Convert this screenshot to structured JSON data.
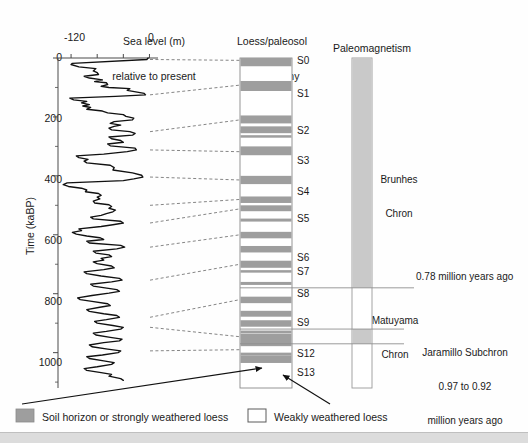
{
  "figure": {
    "title_columns": [
      {
        "name": "sea-level",
        "line1": "Sea level (m)",
        "line2": "relative to present"
      },
      {
        "name": "stratigraphy",
        "line1": "Loess/paleosol",
        "line2": "stratigraphy"
      },
      {
        "name": "paleomagnetism",
        "line1": "Paleomagnetism",
        "line2": ""
      }
    ],
    "y_axis": {
      "label": "Time (kaBP)",
      "ticks": [
        0,
        200,
        400,
        600,
        800,
        1000
      ],
      "minor_ticks": [
        100,
        300,
        500,
        700,
        900,
        1100
      ],
      "range": [
        0,
        1120
      ]
    },
    "x_axis": {
      "labels": [
        "-120",
        "0"
      ],
      "tick_values": [
        -120,
        -80,
        -40,
        0
      ],
      "range": [
        -140,
        10
      ]
    },
    "soil_labels": [
      "S0",
      "S1",
      "S2",
      "S3",
      "S4",
      "S5",
      "S6",
      "S7",
      "S8",
      "S9",
      "S12",
      "S13"
    ],
    "paleomagnetism": {
      "chrons": [
        {
          "name": "Brunhes Chron",
          "line1": "Brunhes",
          "line2": "Chron",
          "polarity": "normal"
        },
        {
          "name": "Matuyama Chron",
          "line1": "Matuyama",
          "line2": "Chron",
          "polarity": "reversed"
        }
      ],
      "subchron": {
        "line1": "Jaramillo Subchron",
        "line2": "0.97 to 0.92",
        "line3": "million years ago"
      },
      "boundary_annotation": "0.78 million years ago"
    },
    "legend": [
      {
        "swatch": "filled",
        "label": "Soil horizon or strongly weathered loess"
      },
      {
        "swatch": "empty",
        "label": "Weakly weathered loess"
      }
    ],
    "colors": {
      "soil_band": "#9e9e9e",
      "loess": "#ffffff",
      "normal_polarity": "#c9c9c9",
      "curve": "#111111",
      "correlation_line": "#777777",
      "axis": "#4a4a4a",
      "text": "#1a1a1a"
    }
  },
  "chart_data": {
    "type": "line",
    "title": "Sea level (m) relative to present",
    "xlabel": "Sea level (m) relative to present",
    "ylabel": "Time (kaBP)",
    "xlim": [
      -140,
      10
    ],
    "ylim": [
      1120,
      0
    ],
    "grid": false,
    "legend_position": "bottom",
    "sea_level_curve": {
      "name": "Sea level relative to present",
      "units_x": "m",
      "units_y": "kaBP",
      "points": [
        [
          -2,
          0
        ],
        [
          -4,
          5
        ],
        [
          -118,
          18
        ],
        [
          -120,
          22
        ],
        [
          -108,
          30
        ],
        [
          -82,
          36
        ],
        [
          -86,
          44
        ],
        [
          -80,
          50
        ],
        [
          -78,
          56
        ],
        [
          -100,
          62
        ],
        [
          -92,
          68
        ],
        [
          -72,
          74
        ],
        [
          -84,
          80
        ],
        [
          -66,
          84
        ],
        [
          -64,
          90
        ],
        [
          -74,
          96
        ],
        [
          -62,
          100
        ],
        [
          -30,
          104
        ],
        [
          -34,
          110
        ],
        [
          -8,
          120
        ],
        [
          -6,
          125
        ],
        [
          -52,
          130
        ],
        [
          -122,
          136
        ],
        [
          -116,
          142
        ],
        [
          -96,
          147
        ],
        [
          -104,
          152
        ],
        [
          -92,
          158
        ],
        [
          -102,
          163
        ],
        [
          -90,
          168
        ],
        [
          -96,
          174
        ],
        [
          -72,
          180
        ],
        [
          -64,
          186
        ],
        [
          -40,
          192
        ],
        [
          -36,
          198
        ],
        [
          -24,
          204
        ],
        [
          -26,
          210
        ],
        [
          -54,
          216
        ],
        [
          -60,
          222
        ],
        [
          -44,
          228
        ],
        [
          -54,
          232
        ],
        [
          -62,
          238
        ],
        [
          -58,
          244
        ],
        [
          -30,
          250
        ],
        [
          -22,
          256
        ],
        [
          -26,
          262
        ],
        [
          -62,
          268
        ],
        [
          -58,
          274
        ],
        [
          -44,
          280
        ],
        [
          -40,
          286
        ],
        [
          -64,
          292
        ],
        [
          -60,
          298
        ],
        [
          -22,
          306
        ],
        [
          -20,
          312
        ],
        [
          -34,
          318
        ],
        [
          -70,
          326
        ],
        [
          -112,
          332
        ],
        [
          -108,
          338
        ],
        [
          -94,
          344
        ],
        [
          -100,
          350
        ],
        [
          -96,
          356
        ],
        [
          -60,
          364
        ],
        [
          -54,
          372
        ],
        [
          -56,
          380
        ],
        [
          -26,
          390
        ],
        [
          -12,
          398
        ],
        [
          -10,
          404
        ],
        [
          -24,
          410
        ],
        [
          -40,
          416
        ],
        [
          -126,
          424
        ],
        [
          -132,
          430
        ],
        [
          -124,
          436
        ],
        [
          -104,
          442
        ],
        [
          -96,
          448
        ],
        [
          -98,
          454
        ],
        [
          -78,
          460
        ],
        [
          -74,
          466
        ],
        [
          -80,
          472
        ],
        [
          -76,
          478
        ],
        [
          -86,
          486
        ],
        [
          -84,
          492
        ],
        [
          -62,
          498
        ],
        [
          -58,
          504
        ],
        [
          -62,
          510
        ],
        [
          -52,
          516
        ],
        [
          -56,
          522
        ],
        [
          -66,
          528
        ],
        [
          -74,
          534
        ],
        [
          -90,
          540
        ],
        [
          -86,
          546
        ],
        [
          -44,
          554
        ],
        [
          -40,
          560
        ],
        [
          -56,
          566
        ],
        [
          -74,
          572
        ],
        [
          -108,
          580
        ],
        [
          -104,
          586
        ],
        [
          -118,
          592
        ],
        [
          -112,
          598
        ],
        [
          -96,
          604
        ],
        [
          -76,
          610
        ],
        [
          -70,
          616
        ],
        [
          -96,
          622
        ],
        [
          -92,
          628
        ],
        [
          -44,
          636
        ],
        [
          -38,
          642
        ],
        [
          -50,
          648
        ],
        [
          -86,
          656
        ],
        [
          -82,
          662
        ],
        [
          -62,
          668
        ],
        [
          -58,
          674
        ],
        [
          -74,
          680
        ],
        [
          -70,
          686
        ],
        [
          -86,
          692
        ],
        [
          -80,
          698
        ],
        [
          -58,
          706
        ],
        [
          -54,
          712
        ],
        [
          -70,
          718
        ],
        [
          -100,
          726
        ],
        [
          -96,
          732
        ],
        [
          -74,
          740
        ],
        [
          -46,
          748
        ],
        [
          -42,
          754
        ],
        [
          -58,
          760
        ],
        [
          -90,
          768
        ],
        [
          -86,
          774
        ],
        [
          -68,
          780
        ],
        [
          -50,
          786
        ],
        [
          -46,
          792
        ],
        [
          -62,
          798
        ],
        [
          -88,
          806
        ],
        [
          -110,
          814
        ],
        [
          -106,
          820
        ],
        [
          -88,
          826
        ],
        [
          -64,
          834
        ],
        [
          -60,
          840
        ],
        [
          -76,
          846
        ],
        [
          -96,
          854
        ],
        [
          -92,
          860
        ],
        [
          -70,
          868
        ],
        [
          -50,
          874
        ],
        [
          -46,
          880
        ],
        [
          -66,
          888
        ],
        [
          -84,
          894
        ],
        [
          -80,
          900
        ],
        [
          -56,
          908
        ],
        [
          -40,
          914
        ],
        [
          -44,
          920
        ],
        [
          -66,
          928
        ],
        [
          -86,
          934
        ],
        [
          -82,
          940
        ],
        [
          -60,
          948
        ],
        [
          -42,
          954
        ],
        [
          -46,
          960
        ],
        [
          -70,
          966
        ],
        [
          -92,
          974
        ],
        [
          -88,
          980
        ],
        [
          -64,
          988
        ],
        [
          -44,
          994
        ],
        [
          -48,
          1000
        ],
        [
          -72,
          1008
        ],
        [
          -96,
          1014
        ],
        [
          -92,
          1020
        ],
        [
          -70,
          1028
        ],
        [
          -54,
          1034
        ],
        [
          -58,
          1040
        ],
        [
          -80,
          1048
        ],
        [
          -100,
          1054
        ],
        [
          -96,
          1060
        ],
        [
          -74,
          1068
        ],
        [
          -58,
          1074
        ],
        [
          -62,
          1080
        ],
        [
          -44,
          1088
        ],
        [
          -40,
          1094
        ]
      ]
    },
    "stratigraphy_bands": [
      {
        "label": "S0",
        "top_ka": 0,
        "bottom_ka": 28,
        "type": "soil"
      },
      {
        "label": "S1",
        "top_ka": 78,
        "bottom_ka": 112,
        "type": "soil"
      },
      {
        "label": "S2",
        "top_ka": 195,
        "bottom_ka": 222,
        "type": "soil"
      },
      {
        "label": "S2b",
        "top_ka": 232,
        "bottom_ka": 252,
        "type": "soil"
      },
      {
        "label": "S3",
        "top_ka": 300,
        "bottom_ka": 330,
        "type": "soil"
      },
      {
        "label": "S4",
        "top_ka": 400,
        "bottom_ka": 428,
        "type": "soil"
      },
      {
        "label": "S5",
        "top_ka": 470,
        "bottom_ka": 492,
        "type": "soil"
      },
      {
        "label": "S5b",
        "top_ka": 500,
        "bottom_ka": 520,
        "type": "soil"
      },
      {
        "label": "S6",
        "top_ka": 590,
        "bottom_ka": 612,
        "type": "soil"
      },
      {
        "label": "S7",
        "top_ka": 638,
        "bottom_ka": 660,
        "type": "soil"
      },
      {
        "label": "S8",
        "top_ka": 688,
        "bottom_ka": 712,
        "type": "soil"
      },
      {
        "label": "S9",
        "top_ka": 810,
        "bottom_ka": 832,
        "type": "soil"
      },
      {
        "label": "S10",
        "top_ka": 858,
        "bottom_ka": 878,
        "type": "soil"
      },
      {
        "label": "S11",
        "top_ka": 890,
        "bottom_ka": 912,
        "type": "soil"
      },
      {
        "label": "S12",
        "top_ka": 935,
        "bottom_ka": 978,
        "type": "soil"
      },
      {
        "label": "S13",
        "top_ka": 1010,
        "bottom_ka": 1035,
        "type": "soil"
      }
    ],
    "correlation_lines_ka": [
      {
        "sea_level_ka": 5,
        "strat_ka": 8
      },
      {
        "sea_level_ka": 125,
        "strat_ka": 92
      },
      {
        "sea_level_ka": 250,
        "strat_ka": 210
      },
      {
        "sea_level_ka": 312,
        "strat_ka": 318
      },
      {
        "sea_level_ka": 404,
        "strat_ka": 414
      },
      {
        "sea_level_ka": 500,
        "strat_ka": 480
      },
      {
        "sea_level_ka": 560,
        "strat_ka": 512
      },
      {
        "sea_level_ka": 642,
        "strat_ka": 600
      },
      {
        "sea_level_ka": 754,
        "strat_ka": 700
      },
      {
        "sea_level_ka": 880,
        "strat_ka": 820
      },
      {
        "sea_level_ka": 914,
        "strat_ka": 946
      },
      {
        "sea_level_ka": 994,
        "strat_ka": 990
      }
    ],
    "paleomagnetic_intervals_ka": [
      {
        "name": "Brunhes",
        "top_ka": 0,
        "bottom_ka": 780,
        "polarity": "normal"
      },
      {
        "name": "Matuyama-upper",
        "top_ka": 780,
        "bottom_ka": 920,
        "polarity": "reversed"
      },
      {
        "name": "Jaramillo",
        "top_ka": 920,
        "bottom_ka": 970,
        "polarity": "normal"
      },
      {
        "name": "Matuyama-lower",
        "top_ka": 970,
        "bottom_ka": 1120,
        "polarity": "reversed"
      }
    ]
  }
}
